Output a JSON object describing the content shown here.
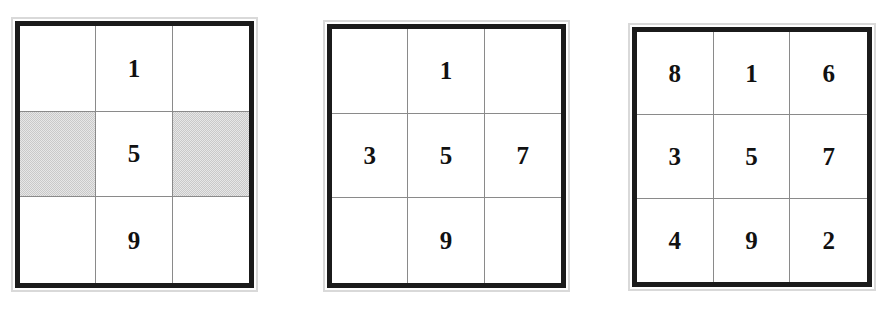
{
  "page": {
    "background_color": "#ffffff",
    "figure_count": 3,
    "caption": ""
  },
  "style": {
    "border_color": "#1b1b1b",
    "gridline_color": "#8a8a8a",
    "shade_color": "#c9c9c9",
    "digit_color": "#111111",
    "halo_color": "#d9d9d9"
  },
  "figures": [
    {
      "name": "partial-magic-square-step-1",
      "label": "",
      "rows": [
        [
          "",
          "1",
          ""
        ],
        [
          "",
          "5",
          ""
        ],
        [
          "",
          "9",
          ""
        ]
      ],
      "shaded_cells": [
        [
          1,
          0
        ],
        [
          1,
          2
        ]
      ],
      "filled_count": 3
    },
    {
      "name": "partial-magic-square-step-2",
      "label": "",
      "rows": [
        [
          "",
          "1",
          ""
        ],
        [
          "3",
          "5",
          "7"
        ],
        [
          "",
          "9",
          ""
        ]
      ],
      "shaded_cells": [],
      "filled_count": 5
    },
    {
      "name": "complete-magic-square-step-3",
      "label": "",
      "rows": [
        [
          "8",
          "1",
          "6"
        ],
        [
          "3",
          "5",
          "7"
        ],
        [
          "4",
          "9",
          "2"
        ]
      ],
      "shaded_cells": [],
      "filled_count": 9
    }
  ]
}
